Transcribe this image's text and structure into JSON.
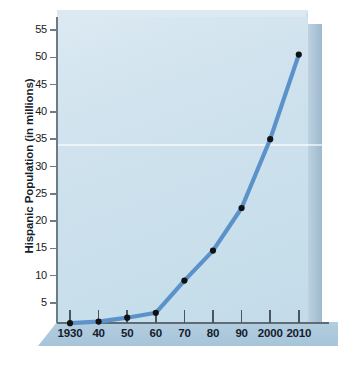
{
  "chart_data": {
    "type": "line",
    "title": "",
    "xlabel": "",
    "ylabel": "Hispanic Population (in millions)",
    "x": [
      1930,
      1940,
      1950,
      1960,
      1970,
      1980,
      1990,
      2000,
      2010
    ],
    "x_tick_labels": [
      "1930",
      "40",
      "50",
      "60",
      "70",
      "80",
      "90",
      "2000",
      "2010"
    ],
    "values": [
      1.3,
      1.6,
      2.3,
      3.2,
      9.1,
      14.6,
      22.4,
      35.0,
      50.5
    ],
    "series": [
      {
        "name": "Hispanic Population",
        "values": [
          1.3,
          1.6,
          2.3,
          3.2,
          9.1,
          14.6,
          22.4,
          35.0,
          50.5
        ]
      }
    ],
    "y_tick_labels": [
      "55",
      "50",
      "45",
      "40",
      "35",
      "30",
      "25",
      "20",
      "15",
      "10",
      "5"
    ],
    "y_ticks": [
      55,
      50,
      45,
      40,
      35,
      30,
      25,
      20,
      15,
      10,
      5
    ],
    "ylim": [
      0,
      57
    ],
    "xlim": [
      1925,
      2015
    ],
    "grid": false,
    "legend": "none",
    "marker": "circle",
    "line_color": "#5b92c9",
    "marker_color": "#111111",
    "plot_background": "#cfe2ed",
    "panel_color": "#a9c2d4"
  },
  "axes": {
    "y_title": "Hispanic Population (in millions)"
  }
}
